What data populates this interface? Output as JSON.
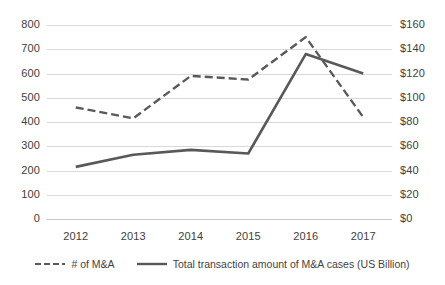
{
  "chart_data": {
    "type": "line",
    "title": "",
    "xlabel": "",
    "ylabel": "",
    "grid": true,
    "legend_position": "bottom",
    "categories": [
      "2012",
      "2013",
      "2014",
      "2015",
      "2016",
      "2017"
    ],
    "x_tick_labels": [
      "2012",
      "2013",
      "2014",
      "2015",
      "2016",
      "2017"
    ],
    "y_left": {
      "label": "",
      "ylim": [
        0,
        800
      ],
      "tick_step": 100,
      "tick_labels": [
        "800",
        "700",
        "600",
        "500",
        "400",
        "300",
        "200",
        "100",
        "0"
      ],
      "tick_values": [
        800,
        700,
        600,
        500,
        400,
        300,
        200,
        100,
        0
      ]
    },
    "y_right": {
      "label": "",
      "ylim": [
        0,
        160
      ],
      "tick_step": 20,
      "tick_labels": [
        "$160",
        "$140",
        "$120",
        "$100",
        "$80",
        "$60",
        "$40",
        "$20",
        "$0"
      ],
      "tick_values": [
        160,
        140,
        120,
        100,
        80,
        60,
        40,
        20,
        0
      ]
    },
    "series": [
      {
        "name": "# of M&A",
        "axis": "left",
        "style": "dashed",
        "color": "#595959",
        "values": [
          460,
          415,
          590,
          575,
          750,
          420
        ]
      },
      {
        "name": "Total transaction amount of M&A cases (US Billion)",
        "axis": "right",
        "style": "solid",
        "color": "#595959",
        "values": [
          43,
          53,
          57,
          54,
          136,
          120
        ]
      }
    ]
  },
  "legend": {
    "items": [
      {
        "label": "# of M&A",
        "style": "dashed"
      },
      {
        "label": "Total transaction amount of M&A cases (US Billion)",
        "style": "solid"
      }
    ]
  }
}
